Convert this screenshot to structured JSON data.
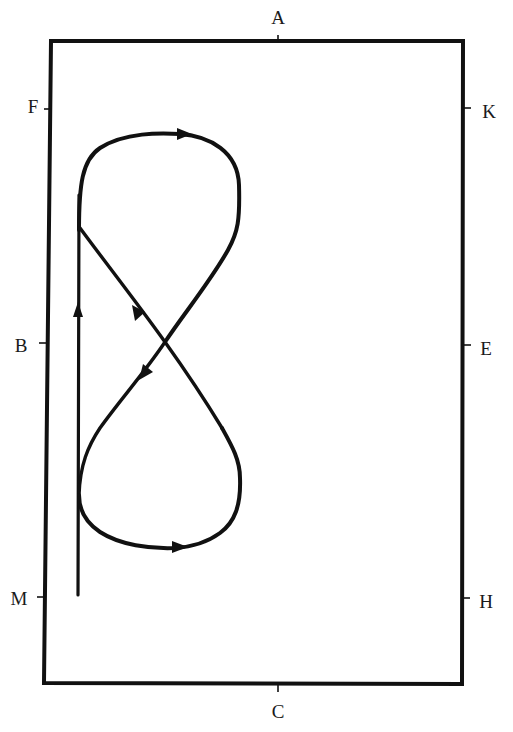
{
  "diagram": {
    "type": "dressage-arena-figure-eight",
    "colors": {
      "background": "#ffffff",
      "stroke": "#111111",
      "label": "#1a1a1a"
    },
    "arena": {
      "shape": "rectangle",
      "corners": {
        "top_left": [
          51,
          41
        ],
        "top_right": [
          463,
          41
        ],
        "bottom_right": [
          462,
          684
        ],
        "bottom_left": [
          44,
          683
        ]
      }
    },
    "markers": [
      {
        "letter": "A",
        "side": "top",
        "label_pos": [
          278,
          17
        ],
        "tick": [
          [
            278,
            36
          ],
          [
            278,
            43
          ]
        ]
      },
      {
        "letter": "K",
        "side": "right",
        "label_pos": [
          489,
          111
        ],
        "tick": [
          [
            463,
            108
          ],
          [
            471,
            108
          ]
        ]
      },
      {
        "letter": "E",
        "side": "right",
        "label_pos": [
          486,
          348
        ],
        "tick": [
          [
            463,
            345
          ],
          [
            471,
            345
          ]
        ]
      },
      {
        "letter": "H",
        "side": "right",
        "label_pos": [
          486,
          601
        ],
        "tick": [
          [
            462,
            598
          ],
          [
            470,
            598
          ]
        ]
      },
      {
        "letter": "C",
        "side": "bottom",
        "label_pos": [
          278,
          711
        ],
        "tick": [
          [
            278,
            684
          ],
          [
            278,
            692
          ]
        ]
      },
      {
        "letter": "M",
        "side": "left",
        "label_pos": [
          19,
          598
        ],
        "tick": [
          [
            37,
            597
          ],
          [
            45,
            597
          ]
        ]
      },
      {
        "letter": "B",
        "side": "left",
        "label_pos": [
          21,
          345
        ],
        "tick": [
          [
            39,
            343
          ],
          [
            47,
            343
          ]
        ]
      },
      {
        "letter": "F",
        "side": "left",
        "label_pos": [
          33,
          106
        ],
        "tick": [
          [
            44,
            109
          ],
          [
            52,
            109
          ]
        ]
      }
    ],
    "path": {
      "description": "Start near M, proceed up the quarter line, ride a figure eight: upper loop clockwise, cross diagonally at centre near B-E line, lower loop, then return to the quarter line.",
      "arrows": [
        {
          "at": [
            78,
            310
          ],
          "direction": "up"
        },
        {
          "at": [
            180,
            134
          ],
          "direction": "right"
        },
        {
          "at": [
            138,
            313
          ],
          "direction": "up-left"
        },
        {
          "at": [
            145,
            372
          ],
          "direction": "down-left"
        },
        {
          "at": [
            178,
            547
          ],
          "direction": "right"
        }
      ],
      "crossing_point": [
        165,
        342
      ]
    }
  }
}
